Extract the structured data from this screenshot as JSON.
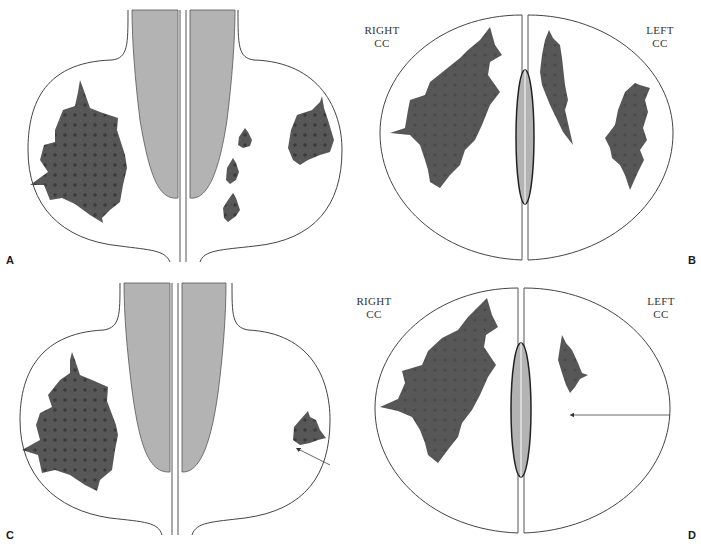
{
  "figure": {
    "colors": {
      "background": "#ffffff",
      "outline": "#444444",
      "pectoral_fill": "#b3b3b3",
      "lesion_fill": "#555555",
      "lesion_dot": "#3a3a3a",
      "divider": "#555555"
    }
  },
  "panels": [
    {
      "id": "A",
      "letter": "A",
      "view": "mlo",
      "lesions": 5
    },
    {
      "id": "B",
      "letter": "B",
      "view": "cc",
      "labels": {
        "right": "RIGHT\nCC",
        "right_line1": "RIGHT",
        "right_line2": "CC",
        "left_line1": "LEFT",
        "left_line2": "CC"
      },
      "lesions": 3
    },
    {
      "id": "C",
      "letter": "C",
      "view": "mlo",
      "lesions": 2,
      "arrow": "points to small lesion in left breast"
    },
    {
      "id": "D",
      "letter": "D",
      "view": "cc",
      "labels": {
        "right_line1": "RIGHT",
        "right_line2": "CC",
        "left_line1": "LEFT",
        "left_line2": "CC"
      },
      "lesions": 2,
      "arrow": "horizontal arrow pointing toward central left breast"
    }
  ]
}
